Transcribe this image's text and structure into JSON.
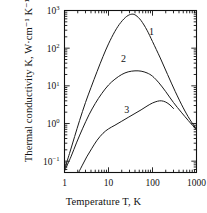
{
  "chart_data": {
    "type": "line",
    "title": "",
    "xlabel": "Temperature T, K",
    "ylabel": "Thermal conductivity K, W·cm⁻¹ K⁻¹",
    "xscale": "log",
    "yscale": "log",
    "xlim": [
      1,
      1000
    ],
    "ylim": [
      0.05,
      1000
    ],
    "xticks": [
      1,
      10,
      100,
      1000
    ],
    "xticklabels": [
      "1",
      "10",
      "100",
      "1000"
    ],
    "yticks": [
      0.1,
      1,
      10,
      100,
      1000
    ],
    "yticklabels": [
      "10⁻¹",
      "10⁰",
      "10¹",
      "10²",
      "10³"
    ],
    "grid": false,
    "legend": "inline-curve-numbers",
    "minor_ticks": true,
    "series": [
      {
        "name": "1",
        "label": "1",
        "color": "#1a1a1a",
        "points": [
          [
            1.0,
            0.06
          ],
          [
            1.3,
            0.16
          ],
          [
            1.7,
            0.45
          ],
          [
            2.2,
            1.2
          ],
          [
            3.0,
            3.6
          ],
          [
            4.0,
            9.0
          ],
          [
            5.5,
            24
          ],
          [
            7.5,
            60
          ],
          [
            10,
            130
          ],
          [
            14,
            280
          ],
          [
            19,
            480
          ],
          [
            26,
            700
          ],
          [
            34,
            800
          ],
          [
            42,
            740
          ],
          [
            55,
            540
          ],
          [
            75,
            300
          ],
          [
            100,
            150
          ],
          [
            150,
            55
          ],
          [
            220,
            20
          ],
          [
            330,
            7.0
          ],
          [
            500,
            2.6
          ],
          [
            700,
            1.3
          ],
          [
            1000,
            0.7
          ]
        ]
      },
      {
        "name": "2",
        "label": "2",
        "color": "#1a1a1a",
        "points": [
          [
            1.0,
            0.055
          ],
          [
            1.4,
            0.13
          ],
          [
            1.9,
            0.32
          ],
          [
            2.6,
            0.75
          ],
          [
            3.6,
            1.7
          ],
          [
            5.0,
            3.4
          ],
          [
            7.0,
            6.2
          ],
          [
            10,
            10.5
          ],
          [
            14,
            15
          ],
          [
            20,
            20
          ],
          [
            28,
            23.5
          ],
          [
            40,
            25
          ],
          [
            55,
            24.5
          ],
          [
            75,
            22
          ],
          [
            100,
            18
          ],
          [
            140,
            12
          ],
          [
            200,
            7.0
          ],
          [
            300,
            3.6
          ],
          [
            450,
            2.0
          ],
          [
            650,
            1.2
          ],
          [
            1000,
            0.68
          ]
        ]
      },
      {
        "name": "3",
        "label": "3",
        "color": "#1a1a1a",
        "points": [
          [
            2.0,
            0.045
          ],
          [
            2.5,
            0.075
          ],
          [
            3.2,
            0.13
          ],
          [
            4.2,
            0.22
          ],
          [
            5.5,
            0.36
          ],
          [
            7.5,
            0.55
          ],
          [
            10,
            0.72
          ],
          [
            14,
            0.9
          ],
          [
            20,
            1.15
          ],
          [
            28,
            1.45
          ],
          [
            40,
            1.85
          ],
          [
            55,
            2.3
          ],
          [
            75,
            2.9
          ],
          [
            100,
            3.5
          ],
          [
            130,
            3.9
          ],
          [
            160,
            4.0
          ],
          [
            200,
            3.7
          ],
          [
            250,
            3.1
          ],
          [
            300,
            2.5
          ]
        ]
      }
    ],
    "annotations": [
      {
        "text": "1",
        "x": 95,
        "y": 230
      },
      {
        "text": "2",
        "x": 22,
        "y": 42
      },
      {
        "text": "3",
        "x": 26,
        "y": 1.9
      }
    ]
  }
}
